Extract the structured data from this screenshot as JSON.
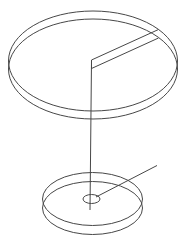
{
  "canvas": {
    "width": 185,
    "height": 241,
    "background": "#ffffff",
    "line_color": "#474747",
    "line_width": 1
  },
  "figure": {
    "shapes": [
      {
        "type": "ellipse",
        "name": "top-disk-upper-rim",
        "cx": 93,
        "cy": 61,
        "rx": 84.5,
        "ry": 50
      },
      {
        "type": "ellipse",
        "name": "top-disk-lower-rim",
        "cx": 93,
        "cy": 69,
        "rx": 84.5,
        "ry": 50
      },
      {
        "type": "line",
        "name": "top-disk-slot-upper-edge",
        "x1": 91.5,
        "y1": 60,
        "x2": 158.5,
        "y2": 29.5
      },
      {
        "type": "line",
        "name": "top-disk-slot-lower-edge",
        "x1": 91.5,
        "y1": 68.5,
        "x2": 158.5,
        "y2": 38
      },
      {
        "type": "line",
        "name": "top-disk-slot-inner-edge",
        "x1": 91.5,
        "y1": 60,
        "x2": 91.5,
        "y2": 68.5
      },
      {
        "type": "line",
        "name": "suspension-wire",
        "x1": 91.5,
        "y1": 60,
        "x2": 90,
        "y2": 210
      },
      {
        "type": "ellipse",
        "name": "lower-disk-upper-rim",
        "cx": 92.5,
        "cy": 199,
        "rx": 50,
        "ry": 26.5
      },
      {
        "type": "ellipse",
        "name": "lower-disk-lower-rim",
        "cx": 92.5,
        "cy": 208,
        "rx": 50,
        "ry": 26.5
      },
      {
        "type": "ellipse",
        "name": "lower-disk-center-hub",
        "cx": 91.5,
        "cy": 199,
        "rx": 8.5,
        "ry": 4.5
      },
      {
        "type": "line",
        "name": "radius-pointer-line",
        "x1": 96,
        "y1": 197,
        "x2": 157,
        "y2": 165.5
      }
    ]
  }
}
